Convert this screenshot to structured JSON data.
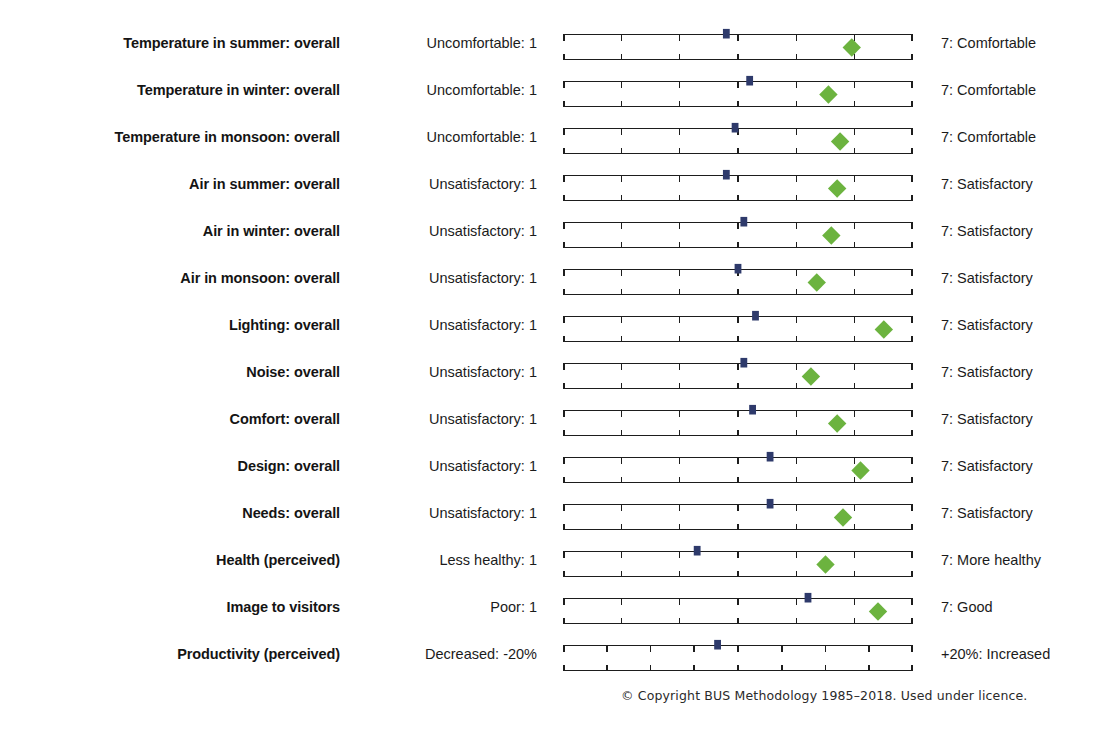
{
  "style": {
    "axis_color": "#1d1d1d",
    "marker_color": "#2e3a6b",
    "score_color": "#6cb33f",
    "text_color": "#1b1b1b"
  },
  "chart_data": {
    "type": "scatter",
    "title": "",
    "xlabel": "",
    "ylabel": "",
    "grid": true,
    "legend": "none",
    "scale_points": 7,
    "xlim": [
      1,
      7
    ],
    "categories": [
      "Temperature in summer: overall",
      "Temperature in winter: overall",
      "Temperature in monsoon: overall",
      "Air in summer: overall",
      "Air in winter: overall",
      "Air in monsoon: overall",
      "Lighting: overall",
      "Noise: overall",
      "Comfort: overall",
      "Design: overall",
      "Needs: overall",
      "Health (perceived)",
      "Image to visitors",
      "Productivity (perceived)"
    ],
    "series": [
      {
        "name": "Score",
        "marker": "green-diamond",
        "values": [
          5.95,
          5.55,
          5.75,
          5.7,
          5.6,
          5.35,
          6.5,
          5.25,
          5.7,
          6.1,
          5.8,
          5.5,
          6.4,
          null
        ]
      },
      {
        "name": "Benchmark",
        "marker": "blue-square",
        "values": [
          3.8,
          4.2,
          3.95,
          3.8,
          4.1,
          4.0,
          4.3,
          4.1,
          4.25,
          4.55,
          4.55,
          3.3,
          5.2,
          3.65
        ]
      }
    ],
    "rows": [
      {
        "label": "Temperature in summer: overall",
        "anchor_low": "Uncomfortable: 1",
        "anchor_high": "7: Comfortable",
        "ticks": 7,
        "benchmark": 3.8,
        "score": 5.95
      },
      {
        "label": "Temperature in winter: overall",
        "anchor_low": "Uncomfortable: 1",
        "anchor_high": "7: Comfortable",
        "ticks": 7,
        "benchmark": 4.2,
        "score": 5.55
      },
      {
        "label": "Temperature in monsoon: overall",
        "anchor_low": "Uncomfortable: 1",
        "anchor_high": "7: Comfortable",
        "ticks": 7,
        "benchmark": 3.95,
        "score": 5.75
      },
      {
        "label": "Air in summer: overall",
        "anchor_low": "Unsatisfactory: 1",
        "anchor_high": "7: Satisfactory",
        "ticks": 7,
        "benchmark": 3.8,
        "score": 5.7
      },
      {
        "label": "Air in winter: overall",
        "anchor_low": "Unsatisfactory: 1",
        "anchor_high": "7: Satisfactory",
        "ticks": 7,
        "benchmark": 4.1,
        "score": 5.6
      },
      {
        "label": "Air in monsoon: overall",
        "anchor_low": "Unsatisfactory: 1",
        "anchor_high": "7: Satisfactory",
        "ticks": 7,
        "benchmark": 4.0,
        "score": 5.35
      },
      {
        "label": "Lighting: overall",
        "anchor_low": "Unsatisfactory: 1",
        "anchor_high": "7: Satisfactory",
        "ticks": 7,
        "benchmark": 4.3,
        "score": 6.5
      },
      {
        "label": "Noise: overall",
        "anchor_low": "Unsatisfactory: 1",
        "anchor_high": "7: Satisfactory",
        "ticks": 7,
        "benchmark": 4.1,
        "score": 5.25
      },
      {
        "label": "Comfort: overall",
        "anchor_low": "Unsatisfactory: 1",
        "anchor_high": "7: Satisfactory",
        "ticks": 7,
        "benchmark": 4.25,
        "score": 5.7
      },
      {
        "label": "Design: overall",
        "anchor_low": "Unsatisfactory: 1",
        "anchor_high": "7: Satisfactory",
        "ticks": 7,
        "benchmark": 4.55,
        "score": 6.1
      },
      {
        "label": "Needs: overall",
        "anchor_low": "Unsatisfactory: 1",
        "anchor_high": "7: Satisfactory",
        "ticks": 7,
        "benchmark": 4.55,
        "score": 5.8
      },
      {
        "label": "Health (perceived)",
        "anchor_low": "Less healthy: 1",
        "anchor_high": "7: More healthy",
        "ticks": 7,
        "benchmark": 3.3,
        "score": 5.5
      },
      {
        "label": "Image to visitors",
        "anchor_low": "Poor: 1",
        "anchor_high": "7: Good",
        "ticks": 7,
        "benchmark": 5.2,
        "score": 6.4
      },
      {
        "label": "Productivity (perceived)",
        "anchor_low": "Decreased: -20%",
        "anchor_high": "+20%: Increased",
        "ticks": 9,
        "benchmark": 3.65,
        "score": null
      }
    ]
  },
  "footer": {
    "copyright": "© Copyright BUS Methodology 1985–2018. Used under licence."
  }
}
